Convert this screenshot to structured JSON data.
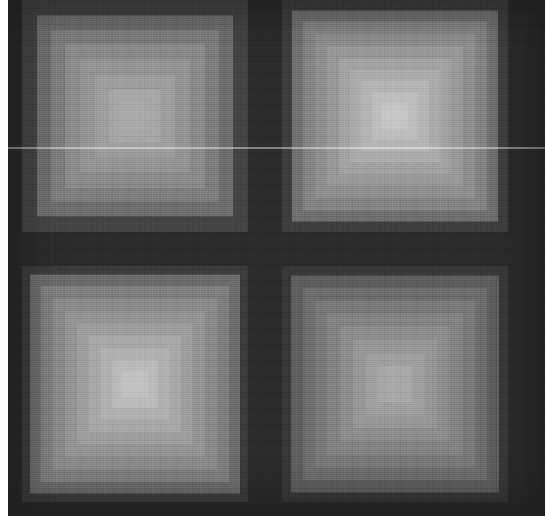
{
  "figure": {
    "type": "heatmap",
    "width": 548,
    "height": 527,
    "background_color": "#ffffff",
    "separator_color": "#2b2b2b",
    "scanline": {
      "y": 147,
      "color": "#ffffff",
      "opacity": 0.42
    },
    "margins": {
      "left": 8,
      "bottom": 11,
      "top": 0,
      "right": 3
    },
    "grid_texture": {
      "cell_size": 16,
      "visible": true
    }
  },
  "chart_data": {
    "type": "heatmap",
    "subtitle": "",
    "xlabel": "",
    "ylabel": "",
    "grid": true,
    "legend_position": "none",
    "colormap": "grayscale",
    "value_range": [
      38,
      201
    ],
    "layout": {
      "rows": 2,
      "cols": 2
    },
    "panels": [
      {
        "name": "top-left",
        "row": 0,
        "col": 0,
        "x": 22,
        "y": 0,
        "width": 226,
        "height": 232,
        "peak_value": 170,
        "base_value": 68,
        "levels": 7,
        "colors": [
          "#444444",
          "#6e6e6e",
          "#7e7e7e",
          "#8b8b8b",
          "#959595",
          "#9e9e9e",
          "#a7a7a7",
          "#aaaaaa"
        ],
        "sizes": [
          226,
          196,
          168,
          140,
          110,
          80,
          52,
          28
        ]
      },
      {
        "name": "top-right",
        "row": 0,
        "col": 1,
        "x": 282,
        "y": 0,
        "width": 226,
        "height": 232,
        "peak_value": 201,
        "base_value": 62,
        "levels": 9,
        "colors": [
          "#3e3e3e",
          "#707070",
          "#848484",
          "#8f8f8f",
          "#999999",
          "#a3a3a3",
          "#acacac",
          "#b5b5b5",
          "#bebebe",
          "#c6c6c6"
        ],
        "sizes": [
          226,
          206,
          184,
          160,
          136,
          112,
          90,
          68,
          46,
          26
        ]
      },
      {
        "name": "bottom-left",
        "row": 1,
        "col": 0,
        "x": 22,
        "y": 266,
        "width": 226,
        "height": 236,
        "peak_value": 196,
        "base_value": 60,
        "levels": 9,
        "colors": [
          "#3c3c3c",
          "#6c6c6c",
          "#7f7f7f",
          "#8a8a8a",
          "#949494",
          "#9e9e9e",
          "#a8a8a8",
          "#b1b1b1",
          "#bababa",
          "#c2c2c2"
        ],
        "sizes": [
          226,
          210,
          188,
          164,
          140,
          116,
          92,
          68,
          46,
          26
        ]
      },
      {
        "name": "bottom-right",
        "row": 1,
        "col": 1,
        "x": 282,
        "y": 266,
        "width": 226,
        "height": 236,
        "peak_value": 172,
        "base_value": 56,
        "levels": 8,
        "colors": [
          "#383838",
          "#5e5e5e",
          "#6e6e6e",
          "#797979",
          "#838383",
          "#8d8d8d",
          "#979797",
          "#a0a0a0",
          "#a8a8a8"
        ],
        "sizes": [
          226,
          208,
          184,
          160,
          136,
          110,
          84,
          58,
          34
        ]
      }
    ]
  }
}
